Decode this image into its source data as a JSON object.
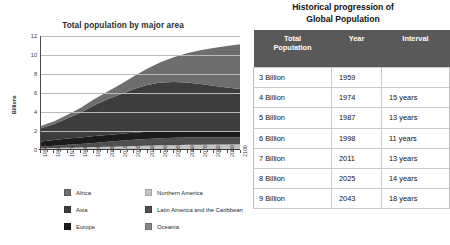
{
  "chart_panel": {
    "title": "Total population by major area",
    "ylabel": "Billions"
  },
  "table_panel": {
    "title_line1": "Historical progression of",
    "title_line2": "Global Population",
    "columns": [
      "Total Population",
      "Year",
      "Interval"
    ],
    "column_header_pop_line1": "Total",
    "column_header_pop_line2": "Population",
    "column_header_year": "Year",
    "column_header_interval": "Interval",
    "rows": [
      {
        "population": "3 Billion",
        "year": "1959",
        "interval": ""
      },
      {
        "population": "4 Billion",
        "year": "1974",
        "interval": "15 years"
      },
      {
        "population": "5 Billion",
        "year": "1987",
        "interval": "13 years"
      },
      {
        "population": "6 Billion",
        "year": "1998",
        "interval": "11 years"
      },
      {
        "population": "7 Billion",
        "year": "2011",
        "interval": "13 years"
      },
      {
        "population": "8 Billion",
        "year": "2025",
        "interval": "14 years"
      },
      {
        "population": "9 Billion",
        "year": "2043",
        "interval": "18 years"
      }
    ],
    "header_bg": "#595959",
    "header_fg": "#ffffff",
    "border_color": "#c9c9c9"
  },
  "legend": {
    "column1": [
      {
        "label": "Africa",
        "color": "#6e6e6e"
      },
      {
        "label": "Asia",
        "color": "#3d3d3d"
      },
      {
        "label": "Europe",
        "color": "#1c1c1c"
      }
    ],
    "column2": [
      {
        "label": "Northern America",
        "color": "#c4c4c4"
      },
      {
        "label": "Latin America and the Caribbean",
        "color": "#4f4f4f"
      },
      {
        "label": "Oceania",
        "color": "#878787"
      }
    ]
  },
  "chart_data": {
    "type": "area",
    "title": "Total population by major area",
    "xlabel": "",
    "ylabel": "Billions",
    "stacked": true,
    "grid": true,
    "legend_position": "bottom",
    "ylim": [
      0,
      12
    ],
    "yticks": [
      0,
      2,
      4,
      6,
      8,
      10,
      12
    ],
    "xlim": [
      1950,
      2100
    ],
    "x": [
      1950,
      1960,
      1970,
      1980,
      1990,
      2000,
      2010,
      2020,
      2030,
      2040,
      2050,
      2060,
      2070,
      2080,
      2090,
      2100
    ],
    "xticklabels": [
      "1950",
      "1960",
      "1970",
      "1980",
      "1990",
      "2000",
      "2010",
      "2020",
      "2030",
      "2040",
      "2050",
      "2060",
      "2070",
      "2080",
      "2090",
      "2100"
    ],
    "series": [
      {
        "name": "Oceania",
        "color": "#878787",
        "values": [
          0.01,
          0.02,
          0.02,
          0.02,
          0.03,
          0.03,
          0.04,
          0.04,
          0.05,
          0.06,
          0.06,
          0.07,
          0.07,
          0.08,
          0.08,
          0.08
        ]
      },
      {
        "name": "Northern America",
        "color": "#c4c4c4",
        "values": [
          0.17,
          0.2,
          0.23,
          0.25,
          0.28,
          0.31,
          0.34,
          0.37,
          0.4,
          0.43,
          0.45,
          0.47,
          0.49,
          0.5,
          0.51,
          0.52
        ]
      },
      {
        "name": "Latin America and the Caribbean",
        "color": "#4f4f4f",
        "values": [
          0.17,
          0.22,
          0.29,
          0.36,
          0.44,
          0.52,
          0.59,
          0.66,
          0.72,
          0.76,
          0.78,
          0.78,
          0.77,
          0.75,
          0.73,
          0.71
        ]
      },
      {
        "name": "Europe",
        "color": "#1c1c1c",
        "values": [
          0.55,
          0.61,
          0.66,
          0.69,
          0.72,
          0.73,
          0.74,
          0.75,
          0.74,
          0.73,
          0.71,
          0.69,
          0.67,
          0.65,
          0.64,
          0.63
        ]
      },
      {
        "name": "Asia",
        "color": "#3d3d3d",
        "values": [
          1.4,
          1.7,
          2.14,
          2.64,
          3.23,
          3.74,
          4.17,
          4.6,
          4.92,
          5.12,
          5.17,
          5.1,
          4.95,
          4.78,
          4.61,
          4.47
        ]
      },
      {
        "name": "Africa",
        "color": "#6e6e6e",
        "values": [
          0.23,
          0.28,
          0.36,
          0.48,
          0.63,
          0.81,
          1.04,
          1.34,
          1.71,
          2.13,
          2.59,
          3.07,
          3.54,
          3.98,
          4.37,
          4.72
        ]
      }
    ],
    "total_values": [
      2.53,
      3.03,
      3.7,
      4.44,
      5.33,
      6.14,
      6.92,
      7.76,
      8.54,
      9.23,
      9.76,
      10.18,
      10.49,
      10.74,
      10.94,
      11.13
    ],
    "annotations": []
  }
}
